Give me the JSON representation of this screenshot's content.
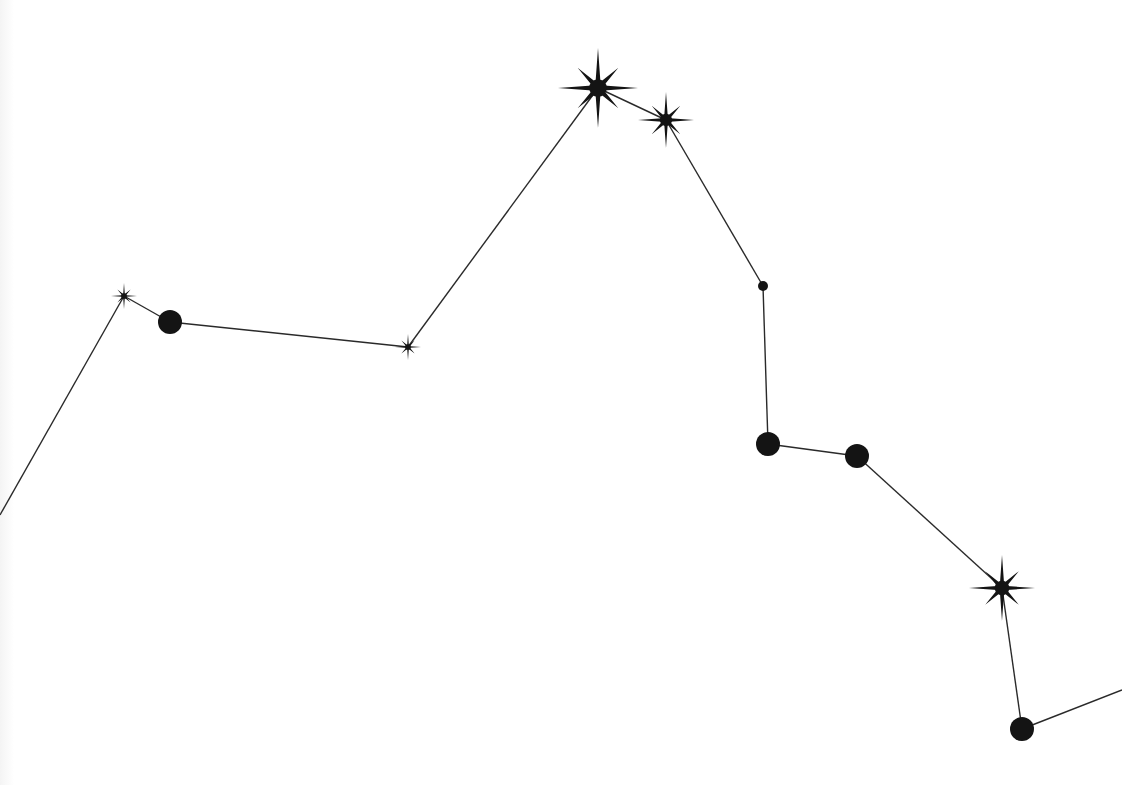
{
  "figure": {
    "kind": "constellation-illustration",
    "width": 1122,
    "height": 785,
    "background_color": "#ffffff",
    "ink_color": "#141414",
    "line_width": 1.4
  },
  "nodes": [
    {
      "id": "n0",
      "type": "edge",
      "x": 0,
      "y": 515,
      "r": 0
    },
    {
      "id": "n1",
      "type": "star",
      "x": 124,
      "y": 296,
      "r": 13
    },
    {
      "id": "n2",
      "type": "circle",
      "x": 170,
      "y": 322,
      "r": 12
    },
    {
      "id": "n3",
      "type": "star",
      "x": 408,
      "y": 347,
      "r": 13
    },
    {
      "id": "n4",
      "type": "star",
      "x": 598,
      "y": 88,
      "r": 40
    },
    {
      "id": "n5",
      "type": "star",
      "x": 666,
      "y": 120,
      "r": 28
    },
    {
      "id": "n6",
      "type": "circle",
      "x": 763,
      "y": 286,
      "r": 5
    },
    {
      "id": "n7",
      "type": "circle",
      "x": 768,
      "y": 444,
      "r": 12
    },
    {
      "id": "n8",
      "type": "circle",
      "x": 857,
      "y": 456,
      "r": 12
    },
    {
      "id": "n9",
      "type": "star",
      "x": 1002,
      "y": 588,
      "r": 33
    },
    {
      "id": "n10",
      "type": "circle",
      "x": 1022,
      "y": 729,
      "r": 12
    },
    {
      "id": "n11",
      "type": "edge",
      "x": 1122,
      "y": 690,
      "r": 0
    }
  ],
  "edges": [
    [
      "n0",
      "n1"
    ],
    [
      "n1",
      "n2"
    ],
    [
      "n2",
      "n3"
    ],
    [
      "n3",
      "n4"
    ],
    [
      "n4",
      "n5"
    ],
    [
      "n5",
      "n6"
    ],
    [
      "n6",
      "n7"
    ],
    [
      "n7",
      "n8"
    ],
    [
      "n8",
      "n9"
    ],
    [
      "n9",
      "n10"
    ],
    [
      "n10",
      "n11"
    ]
  ]
}
